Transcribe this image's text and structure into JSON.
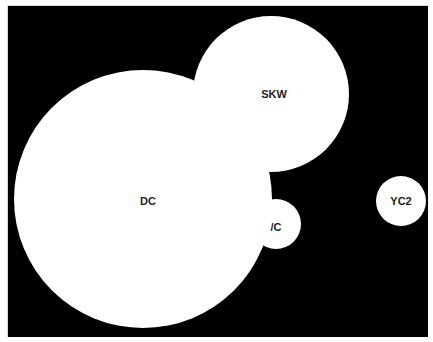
{
  "chart_data": {
    "type": "bubble",
    "title": "",
    "xlabel": "",
    "ylabel": "",
    "background_color": "#000000",
    "bubble_color": "#ffffff",
    "label_color": "#222222",
    "bubbles": [
      {
        "label": "DC",
        "cx": 143,
        "cy": 199,
        "r": 129
      },
      {
        "label": "SKW",
        "cx": 271,
        "cy": 94,
        "r": 78
      },
      {
        "label": "/C",
        "cx": 276,
        "cy": 224,
        "r": 25
      },
      {
        "label": "YC2",
        "cx": 401,
        "cy": 201,
        "r": 25
      }
    ],
    "legend": null,
    "grid": false
  },
  "labels": {
    "dc": "DC",
    "skw": "SKW",
    "vc": "/C",
    "yc2": "YC2"
  }
}
